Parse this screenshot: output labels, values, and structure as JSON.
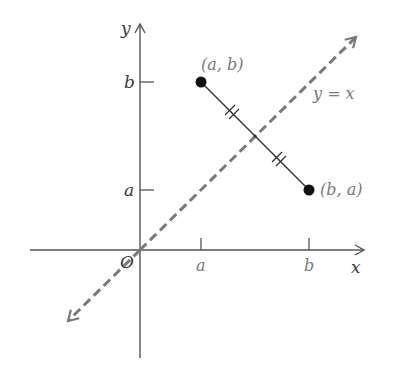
{
  "diagram": {
    "axes": {
      "x_label": "x",
      "y_label": "y",
      "origin_label": "O",
      "x_ticks": [
        "a",
        "b"
      ],
      "y_ticks": [
        "a",
        "b"
      ]
    },
    "points": [
      {
        "label": "(a, b)"
      },
      {
        "label": "(b, a)"
      }
    ],
    "line_label": "y = x",
    "colors": {
      "axis": "#555555",
      "dashed_line": "#7a7a7a",
      "segment": "#333333",
      "point": "#111111"
    }
  }
}
